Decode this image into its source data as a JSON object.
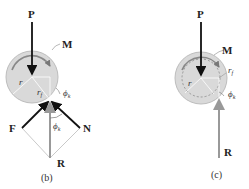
{
  "figure_b": {
    "labels": {
      "P": "P",
      "M": "M",
      "r": "r",
      "rf": "r",
      "rf_sub": "f",
      "phi_top": "ϕ",
      "phi_top_sub": "k",
      "phi_mid": "ϕ",
      "phi_mid_sub": "k",
      "F": "F",
      "N": "N",
      "R": "R",
      "caption": "(b)"
    }
  },
  "figure_c": {
    "labels": {
      "P": "P",
      "M": "M",
      "r": "r",
      "rf": "r",
      "rf_sub": "f",
      "phi": "ϕ",
      "phi_sub": "k",
      "R": "R",
      "caption": "(c)"
    }
  },
  "colors": {
    "wheel_fill": "#d9d9d9",
    "wheel_stroke": "#bdbdbd",
    "force_dark": "#111111",
    "force_gray": "#9a9a9a",
    "construction_line": "#b0b0b0"
  }
}
